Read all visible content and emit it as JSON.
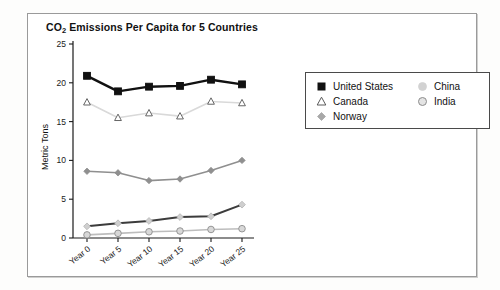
{
  "chart_data": {
    "type": "line",
    "title": "CO2 Emissions Per Capita for 5 Countries",
    "title_main": "CO",
    "title_sub": "2",
    "title_rest": " Emissions Per Capita for 5 Countries",
    "xlabel": "",
    "ylabel": "Metric Tons",
    "categories": [
      "Year 0",
      "Year 5",
      "Year 10",
      "Year 15",
      "Year 20",
      "Year 25"
    ],
    "ylim": [
      0,
      25
    ],
    "yticks": [
      0,
      5,
      10,
      15,
      20,
      25
    ],
    "ytick_labels": [
      "0",
      "5",
      "10",
      "15",
      "20",
      "25"
    ],
    "grid": false,
    "legend_position": "right",
    "series": [
      {
        "name": "United States",
        "values": [
          20.9,
          18.9,
          19.5,
          19.6,
          20.4,
          19.8
        ],
        "color": "#111111",
        "line_color": "#111111",
        "marker": "square-filled"
      },
      {
        "name": "Canada",
        "values": [
          17.5,
          15.5,
          16.1,
          15.7,
          17.6,
          17.4
        ],
        "color": "#d8d8d8",
        "line_color": "#d9d9d9",
        "marker": "triangle-open"
      },
      {
        "name": "Norway",
        "values": [
          8.6,
          8.4,
          7.4,
          7.6,
          8.7,
          10.0
        ],
        "color": "#8f8f8f",
        "line_color": "#8f8f8f",
        "marker": "diamond"
      },
      {
        "name": "China",
        "values": [
          1.5,
          1.9,
          2.2,
          2.7,
          2.8,
          4.3
        ],
        "color": "#cfcfcf",
        "line_color": "#3c3c3c",
        "marker": "diamond-light"
      },
      {
        "name": "India",
        "values": [
          0.4,
          0.6,
          0.8,
          0.9,
          1.1,
          1.2
        ],
        "color": "#c4c4c4",
        "line_color": "#bdbdbd",
        "marker": "circle-open"
      }
    ]
  },
  "legend": {
    "columns": [
      {
        "entries": [
          {
            "label": "United States",
            "marker": "square-filled",
            "color": "#111111"
          },
          {
            "label": "Canada",
            "marker": "triangle-open",
            "color": "#5a5a5a"
          },
          {
            "label": "Norway",
            "marker": "diamond",
            "color": "#a8a8a8"
          }
        ]
      },
      {
        "entries": [
          {
            "label": "China",
            "marker": "circle-light",
            "color": "#d2d2d2"
          },
          {
            "label": "India",
            "marker": "circle-open",
            "color": "#bdbdbd"
          }
        ]
      }
    ]
  },
  "colors": {
    "panel_border": "#9a9a9a",
    "legend_border": "#4a4a4a",
    "axis": "#1a1a1a",
    "background": "#ffffff"
  }
}
